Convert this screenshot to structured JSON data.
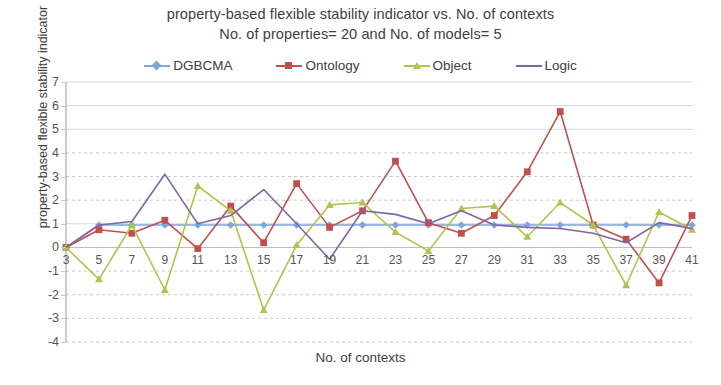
{
  "chart": {
    "title_line1": "property-based  flexible stability indicator vs. No. of contexts",
    "title_line2": "No. of properties=  20 and  No. of models=  5",
    "xlabel": "No. of contexts",
    "ylabel": "property-based flexible stability indicator"
  },
  "chart_data": {
    "type": "line",
    "title": "property-based  flexible stability indicator vs. No. of contexts",
    "subtitle": "No. of properties=  20 and  No. of models=  5",
    "xlabel": "No. of contexts",
    "ylabel": "property-based flexible stability indicator",
    "x": [
      3,
      5,
      7,
      9,
      11,
      13,
      15,
      17,
      19,
      21,
      23,
      25,
      27,
      29,
      31,
      33,
      35,
      37,
      39,
      41
    ],
    "xticks": [
      "3",
      "5",
      "7",
      "9",
      "11",
      "13",
      "15",
      "17",
      "19",
      "21",
      "23",
      "25",
      "27",
      "29",
      "31",
      "33",
      "35",
      "37",
      "39",
      "41"
    ],
    "yticks": [
      -4,
      -3,
      -2,
      -1,
      0,
      1,
      2,
      3,
      4,
      5,
      6,
      7
    ],
    "ylim": [
      -4,
      7
    ],
    "xlim": [
      3,
      41
    ],
    "grid": true,
    "legend_position": "top",
    "series": [
      {
        "name": "DGBCMA",
        "color": "#7da7d9",
        "marker": "diamond",
        "values": [
          0.0,
          0.95,
          0.95,
          0.95,
          0.95,
          0.95,
          0.95,
          0.95,
          0.95,
          0.95,
          0.95,
          0.95,
          0.95,
          0.95,
          0.95,
          0.95,
          0.95,
          0.95,
          0.95,
          0.95
        ]
      },
      {
        "name": "Ontology",
        "color": "#c0504d",
        "marker": "square",
        "values": [
          0.0,
          0.75,
          0.6,
          1.15,
          -0.05,
          1.75,
          0.2,
          2.7,
          0.85,
          1.55,
          3.65,
          1.05,
          0.6,
          1.35,
          3.2,
          5.75,
          0.95,
          0.35,
          -1.5,
          1.35
        ]
      },
      {
        "name": "Object",
        "color": "#b3c34d",
        "marker": "triangle",
        "values": [
          0.0,
          -1.35,
          0.95,
          -1.8,
          2.6,
          1.55,
          -2.65,
          0.1,
          1.8,
          1.9,
          0.65,
          -0.15,
          1.65,
          1.75,
          0.45,
          1.9,
          0.95,
          -1.6,
          1.5,
          0.75
        ]
      },
      {
        "name": "Logic",
        "color": "#8064a2",
        "marker": "none",
        "values": [
          0.0,
          0.95,
          1.1,
          3.1,
          1.0,
          1.35,
          2.45,
          1.0,
          -0.5,
          1.55,
          1.4,
          1.0,
          1.55,
          0.95,
          0.85,
          0.8,
          0.6,
          0.2,
          1.05,
          0.8
        ]
      }
    ]
  }
}
